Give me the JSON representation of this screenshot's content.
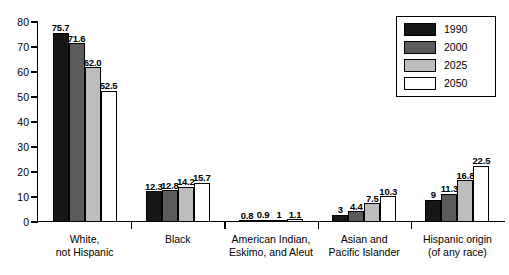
{
  "chart_data": {
    "type": "bar",
    "title": "",
    "subtitle": "",
    "xlabel": "",
    "ylabel": "",
    "ylim": [
      0,
      80
    ],
    "yticks": [
      0,
      10,
      20,
      30,
      40,
      50,
      60,
      70,
      80
    ],
    "grid": false,
    "legend_position": "top-right",
    "categories": [
      "White,\nnot Hispanic",
      "Black",
      "American Indian,\nEskimo, and Aleut",
      "Asian and\nPacific Islander",
      "Hispanic origin\n(of any race)"
    ],
    "category_lines": [
      [
        "White,",
        "not Hispanic"
      ],
      [
        "Black",
        ""
      ],
      [
        "American Indian,",
        "Eskimo, and Aleut"
      ],
      [
        "Asian and",
        "Pacific Islander"
      ],
      [
        "Hispanic origin",
        "(of any race)"
      ]
    ],
    "series": [
      {
        "name": "1990",
        "color": "#161616",
        "values": [
          75.7,
          12.3,
          0.8,
          3,
          9
        ],
        "labels": [
          "75.7",
          "12.3",
          "0.8",
          "3",
          "9"
        ]
      },
      {
        "name": "2000",
        "color": "#5c5c5c",
        "values": [
          71.6,
          12.8,
          0.9,
          4.4,
          11.3
        ],
        "labels": [
          "71.6",
          "12.8",
          "0.9",
          "4.4",
          "11.3"
        ]
      },
      {
        "name": "2025",
        "color": "#bdbdbd",
        "values": [
          62.0,
          14.2,
          1,
          7.5,
          16.8
        ],
        "labels": [
          "62.0",
          "14.2",
          "1",
          "7.5",
          "16.8"
        ]
      },
      {
        "name": "2050",
        "color": "#ffffff",
        "values": [
          52.5,
          15.7,
          1.1,
          10.3,
          22.5
        ],
        "labels": [
          "52.5",
          "15.7",
          "1.1",
          "10.3",
          "22.5"
        ]
      }
    ]
  },
  "legend": {
    "entries": [
      {
        "label": "1990",
        "swatch": "s0"
      },
      {
        "label": "2000",
        "swatch": "s1"
      },
      {
        "label": "2025",
        "swatch": "s2"
      },
      {
        "label": "2050",
        "swatch": "s3"
      }
    ]
  },
  "caption": {
    "text": ""
  }
}
